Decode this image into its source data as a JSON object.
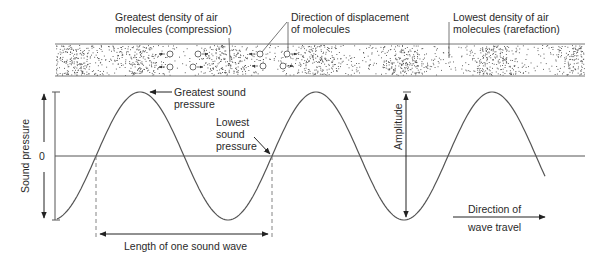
{
  "diagram": {
    "molecule_band": {
      "labels": {
        "compression_line1": "Greatest density of air",
        "compression_line2": "molecules (compression)",
        "displacement_line1": "Direction of displacement",
        "displacement_line2": "of molecules",
        "rarefaction_line1": "Lowest density of air",
        "rarefaction_line2": "molecules (rarefaction)"
      },
      "compression_centers_x": [
        75,
        138,
        228,
        317,
        404,
        493,
        580
      ]
    },
    "wave_plot": {
      "y_axis_label": "Sound pressure",
      "zero_label": "0",
      "greatest_line1": "Greatest  sound",
      "greatest_line2": "pressure",
      "lowest_line1": "Lowest",
      "lowest_line2": "sound",
      "lowest_line3": "pressure",
      "amplitude_label": "Amplitude",
      "wavelength_label": "Length of one sound wave",
      "direction_line1": "Direction of",
      "direction_line2": "wave travel"
    },
    "colors": {
      "line": "#555555",
      "text": "#2a2a2a",
      "dots": "#444444",
      "band_border": "#777777"
    }
  }
}
